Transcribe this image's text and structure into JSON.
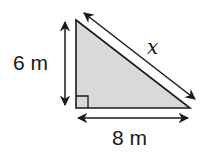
{
  "diagram": {
    "type": "right-triangle",
    "fill_color": "#d9d9d9",
    "stroke_color": "#1a1a1a",
    "vertices": {
      "top": [
        76,
        20
      ],
      "right_angle": [
        76,
        108
      ],
      "right": [
        190,
        108
      ]
    },
    "labels": {
      "height": "6 m",
      "base": "8 m",
      "hypotenuse": "x"
    },
    "right_angle_marker": true
  }
}
